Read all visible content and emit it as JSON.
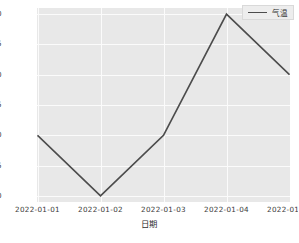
{
  "chart_data": {
    "type": "line",
    "title": "",
    "xlabel": "日期",
    "ylabel": "",
    "categories": [
      "2022-01-01",
      "2022-01-02",
      "2022-01-03",
      "2022-01-04",
      "2022-01-05"
    ],
    "series": [
      {
        "name": "气温",
        "values": [
          16.0,
          15.0,
          16.0,
          18.0,
          17.0
        ],
        "color": "#4c4c4c"
      }
    ],
    "ylim": [
      14.9,
      18.1
    ],
    "yticks": [
      "15.0",
      "15.5",
      "16.0",
      "16.5",
      "17.0",
      "17.5",
      "18.0"
    ],
    "ytick_values": [
      15.0,
      15.5,
      16.0,
      16.5,
      17.0,
      17.5,
      18.0
    ],
    "grid": true,
    "legend_position": "upper right",
    "style": {
      "plot_background": "#e8e8e8",
      "grid_color": "#fbfbfb",
      "figure_background": "#ffffff",
      "tick_color": "#3a3a3a"
    }
  },
  "legend": {
    "entries": [
      {
        "label": "气温",
        "icon": "line-swatch"
      }
    ]
  },
  "axes": {
    "x_label": "日期",
    "x_ticks": [
      "2022-01-01",
      "2022-01-02",
      "2022-01-03",
      "2022-01-04",
      "2022-01-05"
    ],
    "y_ticks": [
      "15.0",
      "15.5",
      "16.0",
      "16.5",
      "17.0",
      "17.5",
      "18.0"
    ]
  }
}
